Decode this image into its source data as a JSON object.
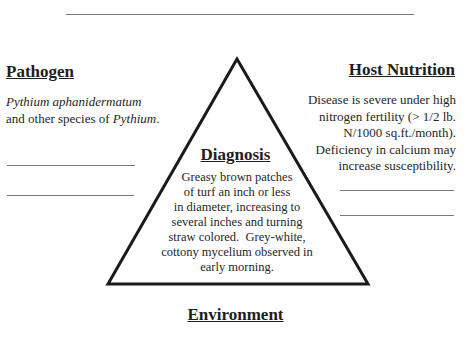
{
  "pathogen": {
    "heading": "Pathogen",
    "species_italic": "Pythium aphanidermatum",
    "line2_prefix": "and other species of ",
    "line2_italic": "Pythium",
    "line2_suffix": "."
  },
  "host_nutrition": {
    "heading": "Host Nutrition",
    "lines": [
      "Disease is severe under high",
      "nitrogen fertility (> 1/2 lb.",
      "N/1000 sq.ft./month).",
      "Deficiency in calcium may",
      "increase susceptibility."
    ]
  },
  "diagnosis": {
    "heading": "Diagnosis",
    "lines": [
      "Greasy brown patches",
      "of turf an inch or less",
      "in diameter, increasing to",
      "several inches and turning",
      "straw colored.  Grey-white,",
      "cottony mycelium observed in",
      "early morning."
    ]
  },
  "environment": {
    "heading": "Environment"
  },
  "colors": {
    "triangle_stroke": "#1a1a1a",
    "rule": "#7a7a7a"
  }
}
